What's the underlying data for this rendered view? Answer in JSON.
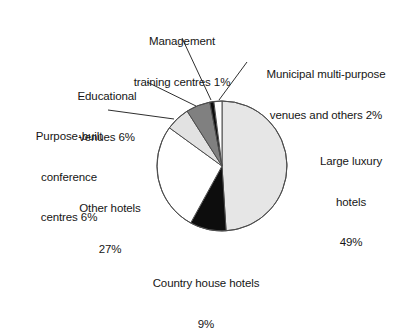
{
  "chart_data": {
    "type": "pie",
    "title": "",
    "xlabel": "",
    "ylabel": "",
    "legend_position": "callout-labels",
    "grid": false,
    "unit": "%",
    "start_angle_deg": 0,
    "direction": "clockwise",
    "categories": [
      "Large luxury hotels",
      "Country house hotels",
      "Other hotels",
      "Purpose-built conference centres",
      "Educational venues",
      "Management training centres",
      "Municipal multi-purpose venues and others"
    ],
    "values": [
      49,
      9,
      27,
      6,
      6,
      1,
      2
    ],
    "slices": [
      {
        "name": "Large luxury hotels",
        "value": 49,
        "color": "#e6e6e6"
      },
      {
        "name": "Country house hotels",
        "value": 9,
        "color": "#0d0d0d"
      },
      {
        "name": "Other hotels",
        "value": 27,
        "color": "#ffffff"
      },
      {
        "name": "Purpose-built conference centres",
        "value": 6,
        "color": "#e2e2e2"
      },
      {
        "name": "Educational venues",
        "value": 6,
        "color": "#808080"
      },
      {
        "name": "Management training centres",
        "value": 1,
        "color": "#0d0d0d"
      },
      {
        "name": "Municipal multi-purpose venues and others",
        "value": 2,
        "color": "#ffffff"
      }
    ]
  },
  "labels": {
    "management": {
      "line1": "Management",
      "line2": "training centres 1%"
    },
    "municipal": {
      "line1": "Municipal multi-purpose",
      "line2": "venues and others 2%"
    },
    "educational": {
      "line1": "Educational",
      "line2": "venues 6%"
    },
    "purpose_built": {
      "line1": "Purpose-built",
      "line2": "conference",
      "line3": "centres 6%"
    },
    "other_hotels": {
      "line1": "Other hotels",
      "line2": "27%"
    },
    "large_luxury": {
      "line1": "Large luxury",
      "line2": "hotels",
      "line3": "49%"
    },
    "country_house": {
      "line1": "Country house hotels",
      "line2": "9%"
    }
  },
  "colors": {
    "stroke": "#4d4d4d",
    "light_grey": "#e6e6e6",
    "mid_grey": "#e2e2e2",
    "dark_grey": "#808080",
    "black": "#0d0d0d",
    "white": "#ffffff",
    "text": "#161616"
  }
}
